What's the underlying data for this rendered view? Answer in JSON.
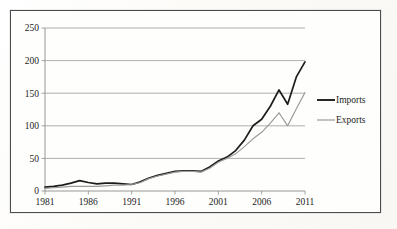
{
  "chart_data": {
    "type": "line",
    "title": "",
    "xlabel": "",
    "ylabel": "",
    "x": [
      1981,
      1982,
      1983,
      1984,
      1985,
      1986,
      1987,
      1988,
      1989,
      1990,
      1991,
      1992,
      1993,
      1994,
      1995,
      1996,
      1997,
      1998,
      1999,
      2000,
      2001,
      2002,
      2003,
      2004,
      2005,
      2006,
      2007,
      2008,
      2009,
      2010,
      2011
    ],
    "xlim": [
      1981,
      2011
    ],
    "ylim": [
      0,
      250
    ],
    "yticks": [
      0,
      50,
      100,
      150,
      200,
      250
    ],
    "xticks": [
      1981,
      1986,
      1991,
      1996,
      2001,
      2006,
      2011
    ],
    "ytick_labels": [
      "0",
      "50",
      "100",
      "150",
      "200",
      "250"
    ],
    "xtick_labels": [
      "1981",
      "1986",
      "1991",
      "1996",
      "2001",
      "2006",
      "2011"
    ],
    "grid": "horizontal",
    "legend_position": "right",
    "series": [
      {
        "name": "Imports",
        "color": "#1c1c1c",
        "width": 1.7,
        "values": [
          6,
          7,
          9,
          12,
          16,
          13,
          11,
          12,
          12,
          11,
          10,
          14,
          20,
          24,
          27,
          30,
          31,
          31,
          30,
          37,
          46,
          52,
          62,
          78,
          100,
          110,
          130,
          155,
          133,
          175,
          198
        ]
      },
      {
        "name": "Exports",
        "color": "#9b9b9b",
        "width": 1.2,
        "values": [
          4,
          5,
          6,
          7,
          7,
          7,
          7,
          8,
          9,
          9,
          10,
          13,
          19,
          23,
          26,
          29,
          30,
          30,
          29,
          35,
          44,
          50,
          57,
          68,
          80,
          90,
          104,
          120,
          100,
          126,
          151
        ]
      }
    ]
  },
  "legend": {
    "items": [
      {
        "label": "Imports",
        "color": "#1c1c1c"
      },
      {
        "label": "Exports",
        "color": "#9b9b9b"
      }
    ]
  }
}
